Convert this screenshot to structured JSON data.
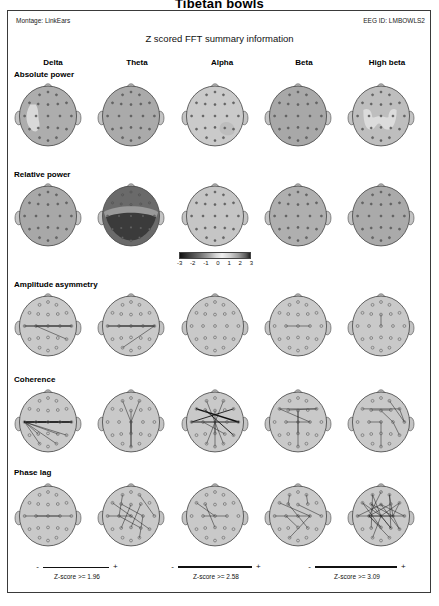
{
  "document": {
    "title": "Tibetan bowls",
    "subtitle": "Z  scored FFT summary information",
    "montage": "Montage: LinkEars",
    "eeg_id": "EEG ID: LMBOWLS2"
  },
  "columns": [
    {
      "label": "Delta"
    },
    {
      "label": "Theta"
    },
    {
      "label": "Alpha"
    },
    {
      "label": "Beta"
    },
    {
      "label": "High beta"
    }
  ],
  "rows": [
    {
      "label": "Absolute power"
    },
    {
      "label": "Relative power"
    },
    {
      "label": "Amplitude asymmetry"
    },
    {
      "label": "Coherence"
    },
    {
      "label": "Phase lag"
    }
  ],
  "color_scale": {
    "ticks": [
      "-3",
      "-2",
      "-1",
      "0",
      "1",
      "2",
      "3"
    ],
    "min": -3,
    "max": 3
  },
  "z_legends": [
    {
      "minus": "-",
      "plus": "+",
      "text": "Z-score >= 1.96"
    },
    {
      "minus": "-",
      "plus": "+",
      "text": "Z-score >= 2.58"
    },
    {
      "minus": "-",
      "plus": "+",
      "text": "Z-score >= 3.09"
    }
  ],
  "chart_data": {
    "type": "heatmap",
    "title": "Tibetan bowls",
    "subtitle": "Z  scored FFT summary information",
    "xlabel": "Frequency band",
    "ylabel": "Metric",
    "categories": [
      "Delta",
      "Theta",
      "Alpha",
      "Beta",
      "High beta"
    ],
    "row_categories": [
      "Absolute power",
      "Relative power",
      "Amplitude asymmetry",
      "Coherence",
      "Phase lag"
    ],
    "zlim": [
      -3,
      3
    ],
    "legend_position": "bottom",
    "grid": false,
    "map_style": [
      "shaded",
      "shaded",
      "connections",
      "connections",
      "connections"
    ],
    "cells": [
      {
        "row": "Absolute power",
        "col": "Delta",
        "style": "shaded",
        "base_z": 0.2,
        "note": "light (high) band along left fronto-temporal region"
      },
      {
        "row": "Absolute power",
        "col": "Theta",
        "style": "shaded",
        "base_z": 0.1,
        "note": "uniform mid-gray, near zero"
      },
      {
        "row": "Absolute power",
        "col": "Alpha",
        "style": "shaded",
        "base_z": 1.4,
        "note": "overall very light; darker patch right posterior-temporal"
      },
      {
        "row": "Absolute power",
        "col": "Beta",
        "style": "shaded",
        "base_z": 0.0,
        "note": "uniform mid-gray"
      },
      {
        "row": "Absolute power",
        "col": "High beta",
        "style": "shaded",
        "base_z": 0.9,
        "note": "light M-shaped central/frontal region"
      },
      {
        "row": "Relative power",
        "col": "Delta",
        "style": "shaded",
        "base_z": 0.0,
        "note": "uniform mid-gray"
      },
      {
        "row": "Relative power",
        "col": "Theta",
        "style": "shaded",
        "base_z": -2.6,
        "note": "strong dark posterior region, darkest occipital"
      },
      {
        "row": "Relative power",
        "col": "Alpha",
        "style": "shaded",
        "base_z": 1.2,
        "note": "uniformly light"
      },
      {
        "row": "Relative power",
        "col": "Beta",
        "style": "shaded",
        "base_z": 0.3,
        "note": "light mid-gray"
      },
      {
        "row": "Relative power",
        "col": "High beta",
        "style": "shaded",
        "base_z": 0.1,
        "note": "uniform mid-gray"
      },
      {
        "row": "Amplitude asymmetry",
        "col": "Delta",
        "style": "connections",
        "count": 3,
        "note": "left-central to right-posterior lines"
      },
      {
        "row": "Amplitude asymmetry",
        "col": "Theta",
        "style": "connections",
        "count": 3,
        "note": "transverse left-to-right lines"
      },
      {
        "row": "Amplitude asymmetry",
        "col": "Alpha",
        "style": "connections",
        "count": 0,
        "note": "no significant pairs"
      },
      {
        "row": "Amplitude asymmetry",
        "col": "Beta",
        "style": "connections",
        "count": 1,
        "note": "single central transverse line"
      },
      {
        "row": "Amplitude asymmetry",
        "col": "High beta",
        "style": "connections",
        "count": 1,
        "note": "single short vertical midline segment"
      },
      {
        "row": "Coherence",
        "col": "Delta",
        "style": "connections",
        "count": 8,
        "note": "fan of lines radiating from left frontal hub"
      },
      {
        "row": "Coherence",
        "col": "Theta",
        "style": "connections",
        "count": 5,
        "note": "midline anterior-posterior lines"
      },
      {
        "row": "Coherence",
        "col": "Alpha",
        "style": "connections",
        "count": 9,
        "note": "dense crossing lines, heavy left-frontal to right-posterior"
      },
      {
        "row": "Coherence",
        "col": "Beta",
        "style": "connections",
        "count": 7,
        "note": "frontal crossing X plus midline"
      },
      {
        "row": "Coherence",
        "col": "High beta",
        "style": "connections",
        "count": 8,
        "note": "frontal crossings and right lateral lines"
      },
      {
        "row": "Phase lag",
        "col": "Delta",
        "style": "connections",
        "count": 2,
        "note": "two shallow transverse central lines"
      },
      {
        "row": "Phase lag",
        "col": "Theta",
        "style": "connections",
        "count": 10,
        "note": "dense web across central and frontal sites"
      },
      {
        "row": "Phase lag",
        "col": "Alpha",
        "style": "connections",
        "count": 3,
        "note": "sparse central lines"
      },
      {
        "row": "Phase lag",
        "col": "Beta",
        "style": "connections",
        "count": 9,
        "note": "moderate web, frontal and central"
      },
      {
        "row": "Phase lag",
        "col": "High beta",
        "style": "connections",
        "count": 22,
        "note": "very dense web spanning frontal-central-temporal"
      }
    ]
  }
}
